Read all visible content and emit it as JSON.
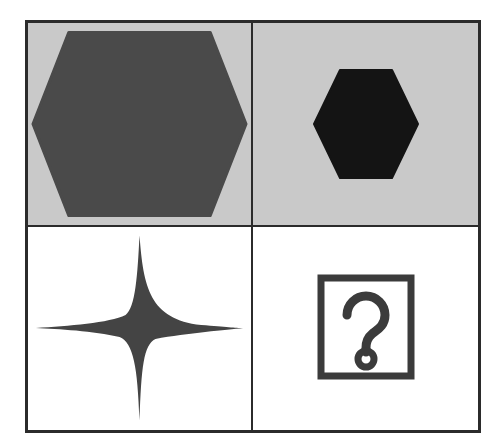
{
  "puzzle": {
    "title": "Visual analogy matrix",
    "layout": "2x2",
    "rows": 2,
    "columns": 2,
    "frame_color": "#2b2b2b",
    "cells": [
      {
        "position": "top-left",
        "row": 0,
        "col": 0,
        "background_label": "light gray",
        "background_color": "#c9c9c9",
        "shape": "hexagon",
        "shape_label": "large dark gray hexagon",
        "shape_color": "#4a4a4a",
        "size_label": "large",
        "is_answer": false
      },
      {
        "position": "top-right",
        "row": 0,
        "col": 1,
        "background_label": "light gray",
        "background_color": "#c9c9c9",
        "shape": "hexagon",
        "shape_label": "small black hexagon",
        "shape_color": "#141414",
        "size_label": "small",
        "is_answer": false
      },
      {
        "position": "bottom-left",
        "row": 1,
        "col": 0,
        "background_label": "white",
        "background_color": "#ffffff",
        "shape": "four-pointed-star",
        "shape_label": "large dark gray four-pointed star",
        "shape_color": "#444444",
        "size_label": "large",
        "is_answer": false
      },
      {
        "position": "bottom-right",
        "row": 1,
        "col": 1,
        "background_label": "white",
        "background_color": "#ffffff",
        "shape": "question-mark-box",
        "shape_label": "question mark placeholder",
        "shape_color": "#3b3b3b",
        "size_label": "medium",
        "is_answer": true,
        "answer_marker": "?"
      }
    ]
  }
}
